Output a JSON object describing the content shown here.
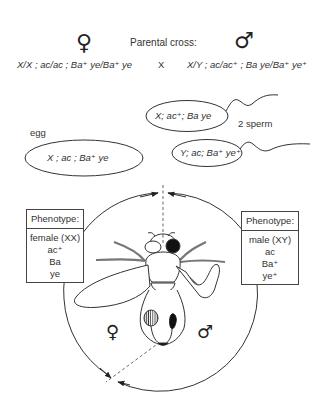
{
  "header": {
    "female_symbol": "♀",
    "male_symbol": "♂",
    "title": "Parental cross:",
    "female_genotype": "X/X ; ac/ac ; Ba⁺ ye/Ba⁺ ye",
    "cross_symbol": "X",
    "male_genotype": "X/Y ; ac/ac⁺ ; Ba ye/Ba⁺ ye⁺"
  },
  "gametes": {
    "egg_label": "egg",
    "egg_genotype": "X ; ac ; Ba⁺ ye",
    "sperm_label": "2 sperm",
    "sperm": [
      {
        "genotype": "X; ac⁺; Ba ye"
      },
      {
        "genotype": "Y; ac; Ba⁺ ye⁺"
      }
    ]
  },
  "phenotype_female": {
    "header": "Phenotype:",
    "lines": [
      "female (XX)",
      "ac⁺",
      "Ba",
      "ye"
    ]
  },
  "phenotype_male": {
    "header": "Phenotype:",
    "lines": [
      "male (XY)",
      "ac",
      "Ba⁺",
      "ye⁺"
    ]
  },
  "fly": {
    "left_side_symbol": "♀",
    "right_side_symbol": "♂"
  },
  "colors": {
    "line": "#333333",
    "background": "#ffffff"
  }
}
